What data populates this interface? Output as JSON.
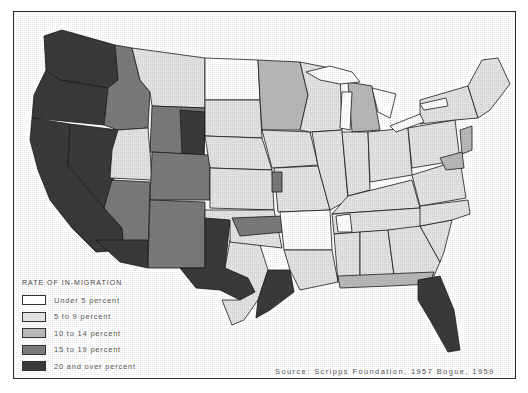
{
  "map": {
    "subject": "United States, rate of in-migration by region",
    "categories": [
      {
        "id": "c1",
        "label": "Under 5 percent",
        "fill": "#ffffff"
      },
      {
        "id": "c2",
        "label": "5 to 9 percent",
        "fill": "#e2e2e2"
      },
      {
        "id": "c3",
        "label": "10 to 14 percent",
        "fill": "#b8b8b8"
      },
      {
        "id": "c4",
        "label": "15 to 19 percent",
        "fill": "#7a7a7a"
      },
      {
        "id": "c5",
        "label": "20 and over percent",
        "fill": "#3a3a3a"
      }
    ]
  },
  "legend": {
    "title": "RATE OF IN-MIGRATION",
    "items": [
      {
        "label": "Under 5 percent",
        "fill": "#ffffff"
      },
      {
        "label": "5 to 9 percent",
        "fill": "#e2e2e2"
      },
      {
        "label": "10 to 14 percent",
        "fill": "#b8b8b8"
      },
      {
        "label": "15 to 19 percent",
        "fill": "#7a7a7a"
      },
      {
        "label": "20 and over percent",
        "fill": "#3a3a3a"
      }
    ]
  },
  "source": "Source: Scripps Foundation, 1957  Bogue, 1959"
}
